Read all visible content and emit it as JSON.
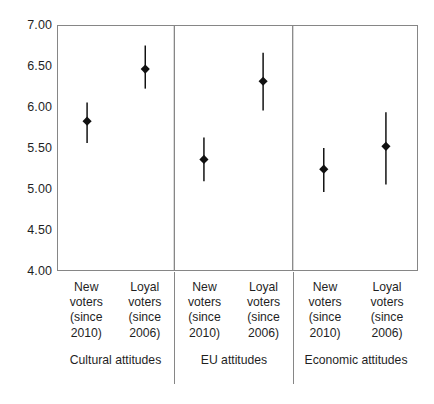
{
  "chart_data": {
    "type": "scatter",
    "title": "",
    "subtitle": "",
    "xlabel": "",
    "ylabel": "",
    "ylim": [
      4.0,
      7.0
    ],
    "ytick_step": 0.5,
    "ytick_labels": [
      "7.00",
      "6.50",
      "6.00",
      "5.50",
      "5.00",
      "4.50",
      "4.00"
    ],
    "ytick_values": [
      7.0,
      6.5,
      6.0,
      5.5,
      5.0,
      4.5,
      4.0
    ],
    "grid": false,
    "legend": false,
    "legend_position": "none",
    "marker": "diamond",
    "marker_color": "#111111",
    "error_bar_color": "#111111",
    "error_bars": "vertical whiskers (confidence intervals)",
    "groups": [
      {
        "name": "Cultural attitudes",
        "categories": [
          "New voters (since 2010)",
          "Loyal voters (since 2006)"
        ]
      },
      {
        "name": "EU attitudes",
        "categories": [
          "New voters (since 2010)",
          "Loyal voters (since 2006)"
        ]
      },
      {
        "name": "Economic attitudes",
        "categories": [
          "New voters (since 2010)",
          "Loyal voters (since 2006)"
        ]
      }
    ],
    "categories": [
      "Cultural attitudes / New voters (since 2010)",
      "Cultural attitudes / Loyal voters (since 2006)",
      "EU attitudes / New voters (since 2010)",
      "EU attitudes / Loyal voters (since 2006)",
      "Economic attitudes / New voters (since 2010)",
      "Economic attitudes / Loyal voters (since 2006)"
    ],
    "values": [
      5.83,
      6.47,
      5.36,
      6.32,
      5.24,
      5.52
    ],
    "ci_low": [
      5.56,
      6.23,
      5.09,
      5.96,
      4.96,
      5.05
    ],
    "ci_high": [
      6.06,
      6.76,
      5.63,
      6.67,
      5.5,
      5.94
    ],
    "points": [
      {
        "group": "Cultural attitudes",
        "category": "New voters (since 2010)",
        "value": 5.83,
        "ci_low": 5.56,
        "ci_high": 6.06
      },
      {
        "group": "Cultural attitudes",
        "category": "Loyal voters (since 2006)",
        "value": 6.47,
        "ci_low": 6.23,
        "ci_high": 6.76
      },
      {
        "group": "EU attitudes",
        "category": "New voters (since 2010)",
        "value": 5.36,
        "ci_low": 5.09,
        "ci_high": 5.63
      },
      {
        "group": "EU attitudes",
        "category": "Loyal voters (since 2006)",
        "value": 6.32,
        "ci_low": 5.96,
        "ci_high": 6.67
      },
      {
        "group": "Economic attitudes",
        "category": "New voters (since 2010)",
        "value": 5.24,
        "ci_low": 4.96,
        "ci_high": 5.5
      },
      {
        "group": "Economic attitudes",
        "category": "Loyal voters (since 2006)",
        "value": 5.52,
        "ci_low": 5.05,
        "ci_high": 5.94
      }
    ]
  },
  "axis": {
    "y_labels": [
      "7.00",
      "6.50",
      "6.00",
      "5.50",
      "5.00",
      "4.50",
      "4.00"
    ]
  },
  "category_axis": {
    "panels": [
      {
        "title": "Cultural attitudes",
        "columns": [
          {
            "line1": "New",
            "line2": "voters",
            "line3": "(since",
            "line4": "2010)"
          },
          {
            "line1": "Loyal",
            "line2": "voters",
            "line3": "(since",
            "line4": "2006)"
          }
        ]
      },
      {
        "title": "EU attitudes",
        "columns": [
          {
            "line1": "New",
            "line2": "voters",
            "line3": "(since",
            "line4": "2010)"
          },
          {
            "line1": "Loyal",
            "line2": "voters",
            "line3": "(since",
            "line4": "2006)"
          }
        ]
      },
      {
        "title": "Economic attitudes",
        "columns": [
          {
            "line1": "New",
            "line2": "voters",
            "line3": "(since",
            "line4": "2010)"
          },
          {
            "line1": "Loyal",
            "line2": "voters",
            "line3": "(since",
            "line4": "2006)"
          }
        ]
      }
    ]
  },
  "colors": {
    "frame": "#868686",
    "marker": "#111111",
    "text": "#1f1f1f",
    "background": "#ffffff"
  }
}
